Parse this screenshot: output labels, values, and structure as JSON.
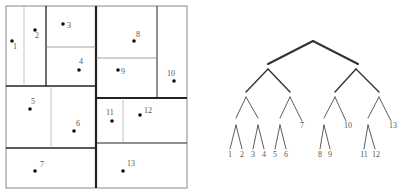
{
  "partition": {
    "points": [
      {
        "label": "1",
        "x": 12,
        "y": 41,
        "lx": 13,
        "ly": 49
      },
      {
        "label": "2",
        "x": 35,
        "y": 30,
        "lx": 35,
        "ly": 38
      },
      {
        "label": "3",
        "x": 63,
        "y": 24,
        "lx": 67,
        "ly": 28
      },
      {
        "label": "4",
        "x": 79,
        "y": 70,
        "lx": 79,
        "ly": 64
      },
      {
        "label": "5",
        "x": 30,
        "y": 109,
        "lx": 31,
        "ly": 104
      },
      {
        "label": "6",
        "x": 74,
        "y": 131,
        "lx": 76,
        "ly": 126
      },
      {
        "label": "7",
        "x": 35,
        "y": 171,
        "lx": 40,
        "ly": 167
      },
      {
        "label": "8",
        "x": 134,
        "y": 41,
        "lx": 136,
        "ly": 37
      },
      {
        "label": "9",
        "x": 118,
        "y": 70,
        "lx": 121,
        "ly": 74
      },
      {
        "label": "10",
        "x": 174,
        "y": 81,
        "lx": 167,
        "ly": 76
      },
      {
        "label": "11",
        "x": 112,
        "y": 121,
        "lx": 106,
        "ly": 115
      },
      {
        "label": "12",
        "x": 140,
        "y": 115,
        "lx": 144,
        "ly": 113
      },
      {
        "label": "13",
        "x": 123,
        "y": 171,
        "lx": 127,
        "ly": 166
      }
    ]
  },
  "tree": {
    "leaves": [
      {
        "label": "1",
        "x": 230,
        "y": 157
      },
      {
        "label": "2",
        "x": 242,
        "y": 157
      },
      {
        "label": "3",
        "x": 253,
        "y": 157
      },
      {
        "label": "4",
        "x": 264,
        "y": 157
      },
      {
        "label": "5",
        "x": 275,
        "y": 157
      },
      {
        "label": "6",
        "x": 286,
        "y": 157
      },
      {
        "label": "7",
        "x": 302,
        "y": 128
      },
      {
        "label": "8",
        "x": 320,
        "y": 157
      },
      {
        "label": "9",
        "x": 330,
        "y": 157
      },
      {
        "label": "10",
        "x": 348,
        "y": 128
      },
      {
        "label": "11",
        "x": 364,
        "y": 157
      },
      {
        "label": "12",
        "x": 376,
        "y": 157
      },
      {
        "label": "13",
        "x": 393,
        "y": 128
      }
    ]
  }
}
